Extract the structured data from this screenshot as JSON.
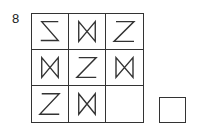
{
  "puzzle": {
    "number": "8",
    "grid": [
      [
        "reversed-z",
        "bowtie",
        "z"
      ],
      [
        "bowtie",
        "z",
        "bowtie"
      ],
      [
        "z",
        "bowtie",
        "empty"
      ]
    ],
    "answer_box": "empty"
  },
  "colors": {
    "stroke": "#333333",
    "background": "#ffffff"
  }
}
